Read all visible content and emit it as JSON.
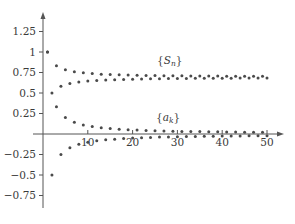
{
  "chart_data": {
    "type": "scatter",
    "title": "",
    "xlabel": "",
    "ylabel": "",
    "xlim": [
      0,
      50
    ],
    "ylim": [
      -0.75,
      1.25
    ],
    "grid": false,
    "legend": "inline annotations",
    "x_ticks": [
      10,
      20,
      30,
      40,
      50
    ],
    "x_tick_labels": [
      "10",
      "20",
      "30",
      "40",
      "50"
    ],
    "y_ticks": [
      1.25,
      1,
      0.75,
      0.5,
      0.25,
      -0.25,
      -0.5,
      -0.75
    ],
    "y_tick_labels": [
      "1.25",
      "1",
      "0.75",
      "0.5",
      "0.25",
      "−0.25",
      "−0.5",
      "−0.75"
    ],
    "annotations": [
      {
        "text": "{S_n}",
        "x": 29,
        "y": 0.87
      },
      {
        "text": "{a_k}",
        "x": 29,
        "y": 0.17
      }
    ],
    "series": [
      {
        "name": "{S_n}",
        "description": "partial sums of alternating harmonic series, converging to ln 2 ≈ 0.693",
        "x": [
          1,
          2,
          3,
          4,
          5,
          6,
          7,
          8,
          9,
          10,
          11,
          12,
          13,
          14,
          15,
          16,
          17,
          18,
          19,
          20,
          21,
          22,
          23,
          24,
          25,
          26,
          27,
          28,
          29,
          30,
          31,
          32,
          33,
          34,
          35,
          36,
          37,
          38,
          39,
          40,
          41,
          42,
          43,
          44,
          45,
          46,
          47,
          48,
          49,
          50
        ],
        "values": [
          1.0,
          0.5,
          0.833,
          0.583,
          0.783,
          0.617,
          0.76,
          0.635,
          0.746,
          0.646,
          0.737,
          0.653,
          0.73,
          0.659,
          0.725,
          0.663,
          0.722,
          0.666,
          0.719,
          0.669,
          0.716,
          0.671,
          0.714,
          0.673,
          0.713,
          0.674,
          0.711,
          0.676,
          0.71,
          0.677,
          0.709,
          0.678,
          0.708,
          0.679,
          0.707,
          0.679,
          0.706,
          0.68,
          0.706,
          0.681,
          0.705,
          0.681,
          0.704,
          0.682,
          0.704,
          0.682,
          0.703,
          0.683,
          0.703,
          0.683
        ]
      },
      {
        "name": "{a_k}",
        "description": "terms (-1)^(k+1)/k, converging to 0",
        "x": [
          1,
          2,
          3,
          4,
          5,
          6,
          7,
          8,
          9,
          10,
          11,
          12,
          13,
          14,
          15,
          16,
          17,
          18,
          19,
          20,
          21,
          22,
          23,
          24,
          25,
          26,
          27,
          28,
          29,
          30,
          31,
          32,
          33,
          34,
          35,
          36,
          37,
          38,
          39,
          40,
          41,
          42,
          43,
          44,
          45,
          46,
          47,
          48,
          49,
          50
        ],
        "values": [
          1.0,
          -0.5,
          0.333,
          -0.25,
          0.2,
          -0.167,
          0.143,
          -0.125,
          0.111,
          -0.1,
          0.091,
          -0.083,
          0.077,
          -0.071,
          0.067,
          -0.063,
          0.059,
          -0.056,
          0.053,
          -0.05,
          0.048,
          -0.045,
          0.043,
          -0.042,
          0.04,
          -0.038,
          0.037,
          -0.036,
          0.034,
          -0.033,
          0.032,
          -0.031,
          0.03,
          -0.029,
          0.029,
          -0.028,
          0.027,
          -0.026,
          0.026,
          -0.025,
          0.024,
          -0.024,
          0.023,
          -0.023,
          0.022,
          -0.022,
          0.021,
          -0.021,
          0.02,
          -0.02
        ]
      }
    ]
  },
  "layout": {
    "origin_px": [
      43,
      134
    ],
    "px_per_x_unit": 4.48,
    "px_per_y_unit": 82,
    "x_axis_end_px": 284,
    "y_axis_top_px": 12,
    "y_axis_bottom_px": 208,
    "dot_color": "#4a4a4a",
    "axis_color": "#555555"
  }
}
